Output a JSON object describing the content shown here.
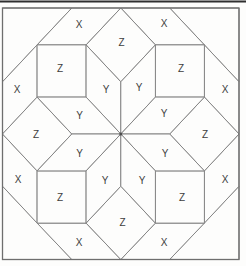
{
  "figure": {
    "canvas": {
      "width": 246,
      "height": 266,
      "background": "#fdfdfc"
    },
    "colors": {
      "fill": "#fdfdfc",
      "inner_line": "#858585",
      "outline": "#6e6e6e",
      "top_rule": "#2f2f2f",
      "label": "#3e3e3e",
      "center_dot": "#4d4d4d"
    },
    "label_font_size": 10,
    "top_rule": {
      "x1": 0,
      "y1": 1.5,
      "x2": 246,
      "y2": 1.5,
      "stroke_width": 2.2
    },
    "outer_square": {
      "x": 2.5,
      "y": 8,
      "width": 236.5,
      "height": 251.5
    },
    "center_dot": {
      "cx": 120.8,
      "cy": 134,
      "r": 1.5
    },
    "labels_used": {
      "square": "Z",
      "star_rhombus": "Y",
      "edge_rhombus": "X"
    },
    "shapes": [
      {
        "id": "corner-triangle-nw",
        "label": "",
        "points": [
          [
            2.5,
            8
          ],
          [
            71.8,
            8
          ],
          [
            2.5,
            81.8
          ]
        ]
      },
      {
        "id": "corner-triangle-ne",
        "label": "",
        "points": [
          [
            169.7,
            8
          ],
          [
            239,
            8
          ],
          [
            239,
            81.8
          ]
        ]
      },
      {
        "id": "corner-triangle-sw",
        "label": "",
        "points": [
          [
            2.5,
            186.2
          ],
          [
            71.8,
            259.5
          ],
          [
            2.5,
            259.5
          ]
        ]
      },
      {
        "id": "corner-triangle-se",
        "label": "",
        "points": [
          [
            239,
            186.2
          ],
          [
            239,
            259.5
          ],
          [
            169.7,
            259.5
          ]
        ]
      },
      {
        "id": "x-rhombus-top-left",
        "label": "X",
        "points": [
          [
            71.8,
            8
          ],
          [
            120.8,
            8
          ],
          [
            86.1,
            44.9
          ],
          [
            37.1,
            44.9
          ]
        ],
        "label_x": 79,
        "label_y": 24
      },
      {
        "id": "x-rhombus-top-right",
        "label": "X",
        "points": [
          [
            120.8,
            8
          ],
          [
            169.7,
            8
          ],
          [
            204.4,
            44.9
          ],
          [
            155.4,
            44.9
          ]
        ],
        "label_x": 164,
        "label_y": 23
      },
      {
        "id": "x-rhombus-left-upper",
        "label": "X",
        "points": [
          [
            2.5,
            81.8
          ],
          [
            37.1,
            44.9
          ],
          [
            37.1,
            97.1
          ],
          [
            2.5,
            134
          ]
        ],
        "label_x": 17,
        "label_y": 89.5
      },
      {
        "id": "x-rhombus-right-upper",
        "label": "X",
        "points": [
          [
            239,
            81.8
          ],
          [
            204.4,
            44.9
          ],
          [
            204.4,
            97.1
          ],
          [
            239,
            134
          ]
        ],
        "label_x": 225,
        "label_y": 89
      },
      {
        "id": "x-rhombus-left-lower",
        "label": "X",
        "points": [
          [
            2.5,
            134
          ],
          [
            37.1,
            170.9
          ],
          [
            37.1,
            223.1
          ],
          [
            2.5,
            186.2
          ]
        ],
        "label_x": 18,
        "label_y": 179.5
      },
      {
        "id": "x-rhombus-right-lower",
        "label": "X",
        "points": [
          [
            239,
            134
          ],
          [
            204.4,
            170.9
          ],
          [
            204.4,
            223.1
          ],
          [
            239,
            186.2
          ]
        ],
        "label_x": 225,
        "label_y": 179.5
      },
      {
        "id": "x-rhombus-bottom-left",
        "label": "X",
        "points": [
          [
            37.1,
            223.1
          ],
          [
            86.1,
            223.1
          ],
          [
            120.8,
            259.5
          ],
          [
            71.8,
            259.5
          ]
        ],
        "label_x": 79,
        "label_y": 242.5
      },
      {
        "id": "x-rhombus-bottom-right",
        "label": "X",
        "points": [
          [
            155.4,
            223.1
          ],
          [
            204.4,
            223.1
          ],
          [
            169.7,
            259.5
          ],
          [
            120.8,
            259.5
          ]
        ],
        "label_x": 164,
        "label_y": 242.5
      },
      {
        "id": "z-square-nw",
        "label": "Z",
        "points": [
          [
            37.1,
            44.9
          ],
          [
            86.1,
            44.9
          ],
          [
            86.1,
            97.1
          ],
          [
            37.1,
            97.1
          ]
        ],
        "label_x": 60,
        "label_y": 68
      },
      {
        "id": "z-square-ne",
        "label": "Z",
        "points": [
          [
            155.4,
            44.9
          ],
          [
            204.4,
            44.9
          ],
          [
            204.4,
            97.1
          ],
          [
            155.4,
            97.1
          ]
        ],
        "label_x": 181,
        "label_y": 68
      },
      {
        "id": "z-square-sw",
        "label": "Z",
        "points": [
          [
            37.1,
            170.9
          ],
          [
            86.1,
            170.9
          ],
          [
            86.1,
            223.1
          ],
          [
            37.1,
            223.1
          ]
        ],
        "label_x": 60,
        "label_y": 197
      },
      {
        "id": "z-square-se",
        "label": "Z",
        "points": [
          [
            155.4,
            170.9
          ],
          [
            204.4,
            170.9
          ],
          [
            204.4,
            223.1
          ],
          [
            155.4,
            223.1
          ]
        ],
        "label_x": 182,
        "label_y": 197
      },
      {
        "id": "z-diamond-n",
        "label": "Z",
        "points": [
          [
            120.8,
            8
          ],
          [
            155.4,
            44.9
          ],
          [
            120.8,
            81.8
          ],
          [
            86.1,
            44.9
          ]
        ],
        "label_x": 121.5,
        "label_y": 42
      },
      {
        "id": "z-diamond-s",
        "label": "Z",
        "points": [
          [
            120.8,
            259.5
          ],
          [
            155.4,
            223.1
          ],
          [
            120.8,
            186.2
          ],
          [
            86.1,
            223.1
          ]
        ],
        "label_x": 122.5,
        "label_y": 222
      },
      {
        "id": "z-diamond-w",
        "label": "Z",
        "points": [
          [
            2.5,
            134
          ],
          [
            37.1,
            97.1
          ],
          [
            71.8,
            134
          ],
          [
            37.1,
            170.9
          ]
        ],
        "label_x": 36,
        "label_y": 134.5
      },
      {
        "id": "z-diamond-e",
        "label": "Z",
        "points": [
          [
            239,
            134
          ],
          [
            204.4,
            97.1
          ],
          [
            169.7,
            134
          ],
          [
            204.4,
            170.9
          ]
        ],
        "label_x": 205,
        "label_y": 134.5
      },
      {
        "id": "y-rhombus-n-nw",
        "label": "Y",
        "points": [
          [
            120.8,
            134
          ],
          [
            120.8,
            81.8
          ],
          [
            86.1,
            44.9
          ],
          [
            86.1,
            97.1
          ]
        ],
        "label_x": 106,
        "label_y": 89.5
      },
      {
        "id": "y-rhombus-n-ne",
        "label": "Y",
        "points": [
          [
            120.8,
            134
          ],
          [
            120.8,
            81.8
          ],
          [
            155.4,
            44.9
          ],
          [
            155.4,
            97.1
          ]
        ],
        "label_x": 139,
        "label_y": 87.5
      },
      {
        "id": "y-rhombus-w-nw",
        "label": "Y",
        "points": [
          [
            120.8,
            134
          ],
          [
            71.8,
            134
          ],
          [
            37.1,
            97.1
          ],
          [
            86.1,
            97.1
          ]
        ],
        "label_x": 79.5,
        "label_y": 115
      },
      {
        "id": "y-rhombus-e-ne",
        "label": "Y",
        "points": [
          [
            120.8,
            134
          ],
          [
            169.7,
            134
          ],
          [
            204.4,
            97.1
          ],
          [
            155.4,
            97.1
          ]
        ],
        "label_x": 164,
        "label_y": 113
      },
      {
        "id": "y-rhombus-w-sw",
        "label": "Y",
        "points": [
          [
            120.8,
            134
          ],
          [
            71.8,
            134
          ],
          [
            37.1,
            170.9
          ],
          [
            86.1,
            170.9
          ]
        ],
        "label_x": 79.5,
        "label_y": 153.5
      },
      {
        "id": "y-rhombus-e-se",
        "label": "Y",
        "points": [
          [
            120.8,
            134
          ],
          [
            169.7,
            134
          ],
          [
            204.4,
            170.9
          ],
          [
            155.4,
            170.9
          ]
        ],
        "label_x": 165,
        "label_y": 153.5
      },
      {
        "id": "y-rhombus-s-sw",
        "label": "Y",
        "points": [
          [
            120.8,
            134
          ],
          [
            120.8,
            186.2
          ],
          [
            86.1,
            223.1
          ],
          [
            86.1,
            170.9
          ]
        ],
        "label_x": 105,
        "label_y": 180
      },
      {
        "id": "y-rhombus-s-se",
        "label": "Y",
        "points": [
          [
            120.8,
            134
          ],
          [
            120.8,
            186.2
          ],
          [
            155.4,
            223.1
          ],
          [
            155.4,
            170.9
          ]
        ],
        "label_x": 142,
        "label_y": 180
      }
    ]
  }
}
